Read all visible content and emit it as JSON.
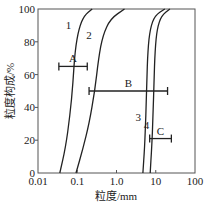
{
  "chart_data": {
    "type": "line",
    "title": "",
    "xlabel": "粒度/mm",
    "ylabel": "粒度构成/%",
    "xscale": "log",
    "xlim": [
      0.01,
      100
    ],
    "ylim": [
      0,
      100
    ],
    "xticks": [
      0.01,
      0.1,
      1.0,
      10,
      100
    ],
    "xtick_labels": [
      "0.01",
      "0.1",
      "1.0",
      "10",
      "100"
    ],
    "yticks": [
      0,
      20,
      40,
      60,
      80,
      100
    ],
    "ytick_labels": [
      "0",
      "20",
      "40",
      "60",
      "80",
      "100"
    ],
    "grid": false,
    "series": [
      {
        "name": "1",
        "points": [
          [
            0.036,
            0
          ],
          [
            0.05,
            15
          ],
          [
            0.065,
            35
          ],
          [
            0.078,
            55
          ],
          [
            0.088,
            75
          ],
          [
            0.11,
            88
          ],
          [
            0.15,
            96
          ],
          [
            0.24,
            100
          ]
        ]
      },
      {
        "name": "2",
        "points": [
          [
            0.093,
            0
          ],
          [
            0.14,
            15
          ],
          [
            0.2,
            30
          ],
          [
            0.28,
            50
          ],
          [
            0.35,
            70
          ],
          [
            0.45,
            84
          ],
          [
            0.7,
            94
          ],
          [
            1.6,
            100
          ]
        ]
      },
      {
        "name": "3",
        "points": [
          [
            4.7,
            0
          ],
          [
            5.2,
            15
          ],
          [
            5.6,
            35
          ],
          [
            5.9,
            55
          ],
          [
            6.3,
            75
          ],
          [
            7.2,
            88
          ],
          [
            9.5,
            96
          ],
          [
            17,
            100
          ]
        ]
      },
      {
        "name": "4",
        "points": [
          [
            7.2,
            0
          ],
          [
            7.9,
            15
          ],
          [
            8.5,
            35
          ],
          [
            9,
            55
          ],
          [
            9.6,
            75
          ],
          [
            10.8,
            88
          ],
          [
            14,
            96
          ],
          [
            23,
            100
          ]
        ]
      }
    ],
    "ranges": [
      {
        "label": "A",
        "y": 65,
        "x_min": 0.034,
        "x_max": 0.18
      },
      {
        "label": "B",
        "y": 50,
        "x_min": 0.2,
        "x_max": 20
      },
      {
        "label": "C",
        "y": 21,
        "x_min": 7,
        "x_max": 25
      }
    ],
    "curve_labels": [
      {
        "text": "1",
        "x": 0.06,
        "y": 88
      },
      {
        "text": "2",
        "x": 0.2,
        "y": 82
      },
      {
        "text": "3",
        "x": 3.6,
        "y": 32
      },
      {
        "text": "4",
        "x": 5.8,
        "y": 27
      }
    ]
  }
}
